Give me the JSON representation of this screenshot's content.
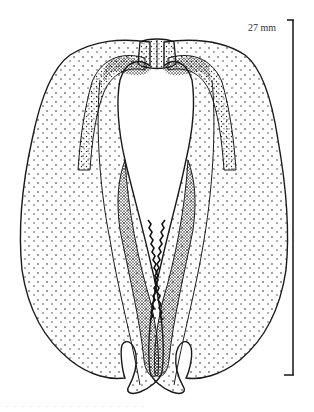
{
  "figure": {
    "style": "black ink stippling on white",
    "colors": {
      "ink": "#1a1a1a",
      "background": "#ffffff"
    }
  },
  "scale_bar": {
    "label": "27 mm",
    "orientation": "vertical",
    "x": 293,
    "y_top": 20,
    "y_bottom": 375
  },
  "caption": {
    "text": ". . . . . . . . . . . . . . . . . ."
  }
}
